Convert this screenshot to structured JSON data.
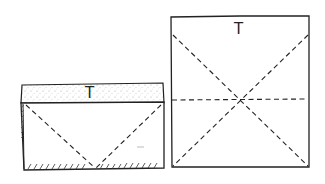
{
  "diagram": {
    "type": "folding-diagram",
    "stroke_color": "#222222",
    "stipple_color": "#9a9a9a",
    "figures": [
      {
        "id": "left-folded",
        "label": "T",
        "top_band": {
          "x": 20,
          "y": 84,
          "width": 144,
          "height": 19,
          "fill": "stippled"
        },
        "body": {
          "x": 20,
          "y": 103,
          "width": 144,
          "height": 67
        },
        "fold_lines": [
          "diagonal-left-to-bottom-center",
          "diagonal-right-to-bottom-center"
        ],
        "hatching": [
          "bottom-edge",
          "left-edge"
        ]
      },
      {
        "id": "right-square",
        "label": "T",
        "box": {
          "x": 171,
          "y": 16,
          "width": 138,
          "height": 151
        },
        "fold_lines": [
          "diagonal-tl-br",
          "diagonal-tr-bl",
          "horizontal-middle"
        ]
      }
    ]
  }
}
